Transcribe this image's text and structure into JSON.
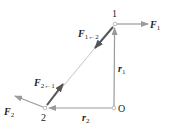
{
  "diagram": {
    "type": "two-particle force diagram",
    "colors": {
      "background": "#ffffff",
      "thin_vector": "#9a9a9a",
      "interaction_force": "#555555",
      "point": "#bbbbbb",
      "text": "#222222"
    },
    "points": {
      "p1": {
        "label": "1",
        "x": 115,
        "y": 24
      },
      "p2": {
        "label": "2",
        "x": 45,
        "y": 108
      },
      "origin": {
        "label": "O",
        "x": 114,
        "y": 108
      }
    },
    "labels": {
      "F1_base": "F",
      "F1_sub": "1",
      "F2_base": "F",
      "F2_sub": "2",
      "F12_base": "F",
      "F12_sub": "1←2",
      "F21_base": "F",
      "F21_sub": "2←1",
      "r1_base": "r",
      "r1_sub": "1",
      "r2_base": "r",
      "r2_sub": "2"
    },
    "vectors": [
      {
        "name": "F1",
        "from": "p1",
        "to": [
          148,
          24
        ],
        "style": "thin"
      },
      {
        "name": "F2",
        "from": "p2",
        "to": [
          15,
          96
        ],
        "style": "thin"
      },
      {
        "name": "F1<-2",
        "from": "p1",
        "to": [
          95,
          48
        ],
        "style": "thick"
      },
      {
        "name": "F2<-1",
        "from": "p2",
        "to": [
          63,
          84
        ],
        "style": "thick"
      },
      {
        "name": "r1",
        "from": "origin",
        "to": "p1",
        "style": "thin"
      },
      {
        "name": "r2",
        "from": "origin",
        "to": "p2",
        "style": "thin"
      }
    ]
  }
}
